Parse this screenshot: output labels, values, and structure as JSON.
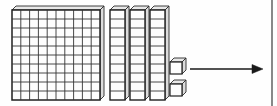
{
  "figure": {
    "title": "Base-ten blocks place value model",
    "background_color": "#fefefe",
    "ink_color": "#1a1a1a",
    "fill_color": "#fdfdfd",
    "shade_color": "#d9d9d9",
    "width": 277,
    "height": 106
  },
  "blocks": {
    "flat": {
      "label": "hundreds-flat",
      "count": 1,
      "value": 100,
      "rows": 10,
      "columns": 10,
      "cells": 100,
      "x": 12,
      "y": 10,
      "width": 88,
      "height": 90
    },
    "rods": {
      "label": "tens-rod",
      "count": 3,
      "value_each": 10,
      "segments": 10,
      "total_value": 30,
      "x_positions": [
        110,
        130,
        150
      ],
      "y": 10,
      "width": 15,
      "height": 90
    },
    "units": {
      "label": "ones-cube",
      "count": 2,
      "value_each": 1,
      "total_value": 2,
      "positions": [
        {
          "x": 170,
          "y": 62
        },
        {
          "x": 170,
          "y": 84
        }
      ],
      "size": 12
    },
    "total_value": 132
  },
  "arrow": {
    "label": "equals-arrow",
    "direction": "right",
    "x_start": 190,
    "x_end": 263,
    "y": 69,
    "head_length": 9,
    "head_width": 8,
    "stroke_width": 1.6
  },
  "page_rule": {
    "label": "page-edge-rule",
    "x": 272,
    "y_start": 0,
    "y_end": 106,
    "stroke_width": 1.2
  }
}
